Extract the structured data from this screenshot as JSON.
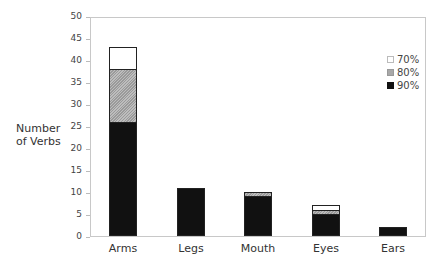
{
  "chart_data": {
    "type": "bar",
    "stacked": true,
    "title": "",
    "xlabel": "",
    "ylabel": "Number of Verbs",
    "ylim": [
      0,
      50
    ],
    "yticks": [
      0,
      5,
      10,
      15,
      20,
      25,
      30,
      35,
      40,
      45,
      50
    ],
    "categories": [
      "Arms",
      "Legs",
      "Mouth",
      "Eyes",
      "Ears"
    ],
    "series": [
      {
        "name": "90%",
        "color": "#111111",
        "values": [
          26,
          11,
          9,
          5,
          2
        ]
      },
      {
        "name": "80%",
        "color": "#aaaaaa",
        "pattern": "hatched",
        "values": [
          12,
          0,
          1,
          1,
          0
        ]
      },
      {
        "name": "70%",
        "color": "#ffffff",
        "values": [
          5,
          0,
          0,
          1,
          0
        ]
      }
    ],
    "legend": {
      "position": "top-right",
      "entries": [
        "70%",
        "80%",
        "90%"
      ]
    },
    "grid": false
  },
  "labels": {
    "ylabel_line1": "Number",
    "ylabel_line2": "of Verbs",
    "yticks": [
      "0",
      "5",
      "10",
      "15",
      "20",
      "25",
      "30",
      "35",
      "40",
      "45",
      "50"
    ],
    "categories": [
      "Arms",
      "Legs",
      "Mouth",
      "Eyes",
      "Ears"
    ],
    "legend": [
      "70%",
      "80%",
      "90%"
    ]
  }
}
